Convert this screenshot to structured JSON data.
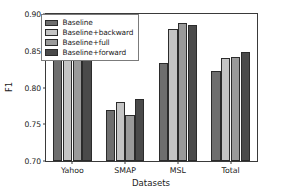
{
  "chart_data": {
    "type": "bar",
    "title": "",
    "xlabel": "Datasets",
    "ylabel": "F1",
    "categories": [
      "Yahoo",
      "SMAP",
      "MSL",
      "Total"
    ],
    "ylim": [
      0.7,
      0.9
    ],
    "yticks": [
      "0.70",
      "0.75",
      "0.80",
      "0.85",
      "0.90"
    ],
    "ytick_values": [
      0.7,
      0.75,
      0.8,
      0.85,
      0.9
    ],
    "grid": false,
    "legend_position": "upper left",
    "series": [
      {
        "name": "Baseline",
        "color": "#6e6e6e",
        "values": [
          0.859,
          0.77,
          0.833,
          0.823
        ]
      },
      {
        "name": "Baseline+backward",
        "color": "#c4c4c4",
        "values": [
          0.853,
          0.78,
          0.879,
          0.84
        ]
      },
      {
        "name": "Baseline+full",
        "color": "#9a9a9a",
        "values": [
          0.865,
          0.763,
          0.888,
          0.841
        ]
      },
      {
        "name": "Baseline+forward",
        "color": "#4a4a4a",
        "values": [
          0.869,
          0.784,
          0.885,
          0.848
        ]
      }
    ]
  },
  "legend": {
    "items": [
      {
        "label": "Baseline"
      },
      {
        "label": "Baseline+backward"
      },
      {
        "label": "Baseline+full"
      },
      {
        "label": "Baseline+forward"
      }
    ]
  }
}
